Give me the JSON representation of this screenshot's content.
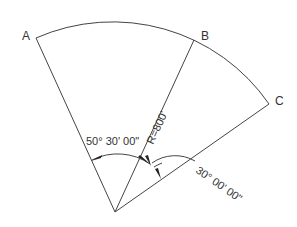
{
  "diagram": {
    "type": "circular-sector",
    "points": {
      "A": "A",
      "B": "B",
      "C": "C"
    },
    "radius_label": "R=800'",
    "angle_AOB_label": "50° 30' 00\"",
    "angle_BOC_label": "30° 00' 00\"",
    "colors": {
      "line": "#444444",
      "text": "#333333"
    }
  }
}
